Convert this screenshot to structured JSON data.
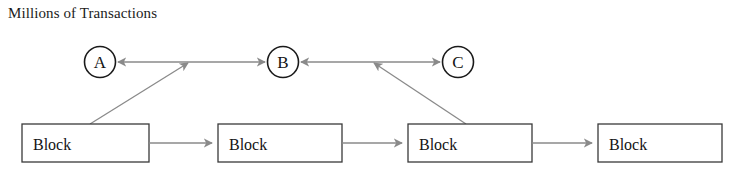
{
  "title": "Millions of Transactions",
  "diagram": {
    "type": "block-chain-transaction-flow",
    "nodes": [
      {
        "id": "A",
        "label": "A",
        "shape": "circle",
        "cx": 100,
        "cy": 62,
        "r": 15.5
      },
      {
        "id": "B",
        "label": "B",
        "shape": "circle",
        "cx": 283,
        "cy": 62,
        "r": 15.5
      },
      {
        "id": "C",
        "label": "C",
        "shape": "circle",
        "cx": 458,
        "cy": 62,
        "r": 15.5
      }
    ],
    "blocks": [
      {
        "id": "block1",
        "label": "Block",
        "x": 22,
        "y": 124,
        "w": 127,
        "h": 38
      },
      {
        "id": "block2",
        "label": "Block",
        "x": 218,
        "y": 124,
        "w": 124,
        "h": 38
      },
      {
        "id": "block3",
        "label": "Block",
        "x": 408,
        "y": 124,
        "w": 124,
        "h": 38
      },
      {
        "id": "block4",
        "label": "Block",
        "x": 598,
        "y": 124,
        "w": 124,
        "h": 38
      }
    ],
    "edges": [
      {
        "id": "edge-junction-to-a",
        "from": "junction-left",
        "to": "A",
        "direction": "left"
      },
      {
        "id": "edge-junction-to-b",
        "from": "junction-left",
        "to": "B",
        "direction": "right"
      },
      {
        "id": "edge-block1-to-junction",
        "from": "block1",
        "to": "junction-left",
        "direction": "up-right"
      },
      {
        "id": "edge-junction-right-to-b",
        "from": "junction-right",
        "to": "B",
        "direction": "left"
      },
      {
        "id": "edge-junction-right-to-c",
        "from": "junction-right",
        "to": "C",
        "direction": "right"
      },
      {
        "id": "edge-block3-to-junction",
        "from": "block3",
        "to": "junction-right",
        "direction": "up-left"
      },
      {
        "id": "edge-block1-to-block2",
        "from": "block1",
        "to": "block2",
        "direction": "right"
      },
      {
        "id": "edge-block2-to-block3",
        "from": "block2",
        "to": "block3",
        "direction": "right"
      },
      {
        "id": "edge-block3-to-block4",
        "from": "block3",
        "to": "block4",
        "direction": "right"
      }
    ],
    "colors": {
      "background": "#ffffff",
      "connector": "#8a8a8a",
      "node_stroke": "#1a1a1a",
      "block_stroke": "#3a3a3a",
      "text": "#141414"
    }
  }
}
